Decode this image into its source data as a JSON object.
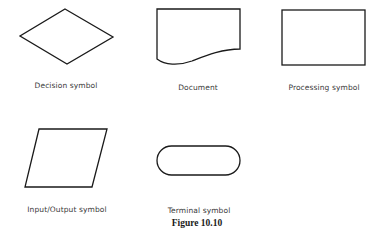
{
  "figure": {
    "caption": "Figure 10.10",
    "symbols": [
      {
        "id": "decision",
        "label": "Decision symbol",
        "shape": "diamond"
      },
      {
        "id": "document",
        "label": "Document",
        "shape": "document"
      },
      {
        "id": "processing",
        "label": "Processing symbol",
        "shape": "rectangle"
      },
      {
        "id": "input-output",
        "label": "Input/Output symbol",
        "shape": "parallelogram"
      },
      {
        "id": "terminal",
        "label": "Terminal symbol",
        "shape": "rounded-rectangle"
      }
    ]
  },
  "colors": {
    "stroke": "#1a1a1a",
    "label": "#3a3a3a",
    "background": "#ffffff"
  }
}
